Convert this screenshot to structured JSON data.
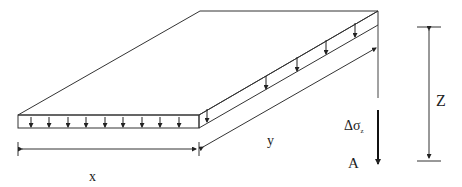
{
  "diagram": {
    "labels": {
      "x": "x",
      "y": "y",
      "z": "Z",
      "stress": "Δσ",
      "stress_subscript": "z",
      "point": "A"
    },
    "load_arrows": {
      "front_edge_count": 9,
      "side_edge_count": 5
    },
    "colors": {
      "line": "#333333",
      "background": "#ffffff"
    }
  }
}
